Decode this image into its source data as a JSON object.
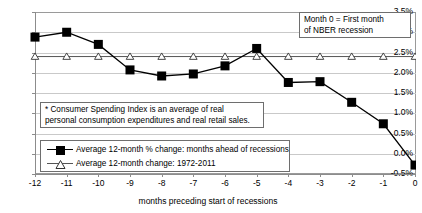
{
  "chart_data": {
    "type": "line",
    "title": "",
    "xlabel": "months preceding start of recessions",
    "ylabel": "",
    "x": [
      -12,
      -11,
      -10,
      -9,
      -8,
      -7,
      -6,
      -5,
      -4,
      -3,
      -2,
      -1,
      0
    ],
    "xtick_labels": [
      "-12",
      "-11",
      "-10",
      "-9",
      "-8",
      "-7",
      "-6",
      "-5",
      "-4",
      "-3",
      "-2",
      "-1",
      "0"
    ],
    "ytick_labels": [
      "3.5%",
      "3.0%",
      "2.5%",
      "2.0%",
      "1.5%",
      "1.0%",
      "0.5%",
      "0.0%",
      "-0.5%"
    ],
    "ytick_values": [
      3.5,
      3.0,
      2.5,
      2.0,
      1.5,
      1.0,
      0.5,
      0.0,
      -0.5
    ],
    "ylim": [
      -0.5,
      3.5
    ],
    "xlim": [
      -12,
      0
    ],
    "grid": true,
    "legend_position": "inside-lower-left",
    "series": [
      {
        "name": "Average 12-month % change: months ahead of recessions",
        "marker": "filled-square",
        "color": "#000000",
        "values": [
          2.88,
          3.0,
          2.7,
          2.07,
          1.92,
          1.97,
          2.17,
          2.6,
          1.76,
          1.78,
          1.27,
          0.74,
          -0.28
        ]
      },
      {
        "name": "Average 12-month change: 1972-2011",
        "marker": "open-triangle",
        "color": "#555555",
        "values": [
          2.4,
          2.4,
          2.4,
          2.4,
          2.4,
          2.4,
          2.4,
          2.4,
          2.4,
          2.4,
          2.4,
          2.4,
          2.4
        ]
      }
    ],
    "annotations": [
      {
        "name": "month-zero-note",
        "line1": "Month 0 = First month",
        "line2": "of NBER recession"
      },
      {
        "name": "consumer-spending-index-note",
        "line1": "* Consumer Spending Index is an average of real",
        "line2": "personal consumption expenditures and real retail sales."
      }
    ]
  },
  "legend": {
    "items": [
      {
        "label": "Average 12-month % change: months ahead of recessions",
        "marker": "filled-square"
      },
      {
        "label": "Average 12-month change: 1972-2011",
        "marker": "open-triangle"
      }
    ]
  },
  "colors": {
    "series_primary": "#000000",
    "series_secondary": "#555555",
    "gridline": "#c9c9c9",
    "axis": "#8c8c8c",
    "plot_background": "#ffffff"
  }
}
